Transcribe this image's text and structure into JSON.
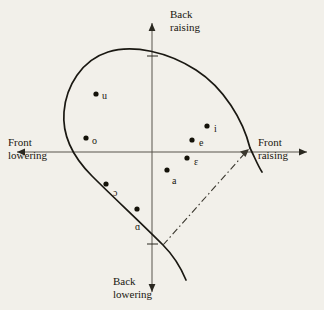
{
  "figure": {
    "background_color": "#f2f0ea",
    "ink_color": "#19170f",
    "axis_color": "#4a4740"
  },
  "axes": {
    "vertical_top": {
      "line1": "Back",
      "line2": "raising"
    },
    "vertical_bottom": {
      "line1": "Back",
      "line2": "lowering"
    },
    "horizontal_left": {
      "line1": "Front",
      "line2": "lowering"
    },
    "horizontal_right": {
      "line1": "Front",
      "line2": "raising"
    }
  },
  "chart_data": {
    "type": "scatter",
    "title": "",
    "xlabel": "Front lowering ↔ Front raising",
    "ylabel": "Back lowering ↔ Back raising",
    "origin_px": {
      "x": 152,
      "y": 152
    },
    "grid": false,
    "legend": null,
    "points": [
      {
        "label": "u",
        "px": 96,
        "py": 94,
        "label_dx": 6,
        "label_dy": -4
      },
      {
        "label": "o",
        "px": 86,
        "py": 138,
        "label_dx": 6,
        "label_dy": -3
      },
      {
        "label": "i",
        "px": 207,
        "py": 126,
        "label_dx": 7,
        "label_dy": -3
      },
      {
        "label": "e",
        "px": 192,
        "py": 140,
        "label_dx": 7,
        "label_dy": -3
      },
      {
        "label": "ɛ",
        "px": 187,
        "py": 158,
        "label_dx": 7,
        "label_dy": -2
      },
      {
        "label": "a",
        "px": 167,
        "py": 170,
        "label_dx": 5,
        "label_dy": 5
      },
      {
        "label": "ɔ",
        "px": 106,
        "py": 184,
        "label_dx": 7,
        "label_dy": 3
      },
      {
        "label": "ɑ",
        "px": 137,
        "py": 209,
        "label_dx": -2,
        "label_dy": 12
      }
    ],
    "annotations": [
      {
        "name": "dash-dot-arrow",
        "style": "dash-dot",
        "from_px": {
          "x": 163,
          "y": 245
        },
        "to_px": {
          "x": 249,
          "y": 149
        }
      },
      {
        "name": "vowel-space-outline",
        "style": "solid-open-loop"
      }
    ],
    "ticks": [
      {
        "axis": "y",
        "px": 152,
        "py": 56
      },
      {
        "axis": "y",
        "px": 152,
        "py": 244
      }
    ]
  }
}
